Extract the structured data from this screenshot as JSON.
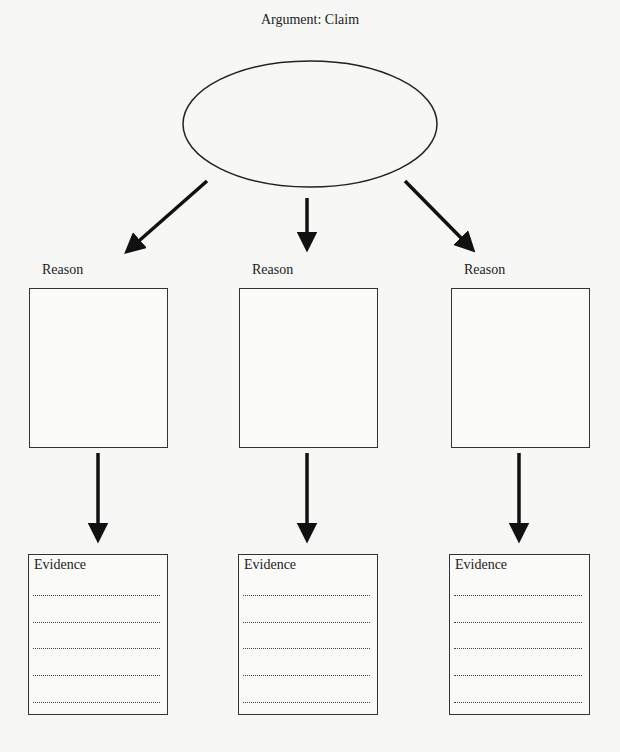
{
  "title": "Argument: Claim",
  "claim": {
    "value": ""
  },
  "reasons": [
    {
      "label": "Reason",
      "value": ""
    },
    {
      "label": "Reason",
      "value": ""
    },
    {
      "label": "Reason",
      "value": ""
    }
  ],
  "evidence": [
    {
      "label": "Evidence",
      "lines": [
        "",
        "",
        "",
        "",
        ""
      ]
    },
    {
      "label": "Evidence",
      "lines": [
        "",
        "",
        "",
        "",
        ""
      ]
    },
    {
      "label": "Evidence",
      "lines": [
        "",
        "",
        "",
        "",
        ""
      ]
    }
  ],
  "colors": {
    "stroke": "#222222",
    "background": "#f7f7f5"
  }
}
